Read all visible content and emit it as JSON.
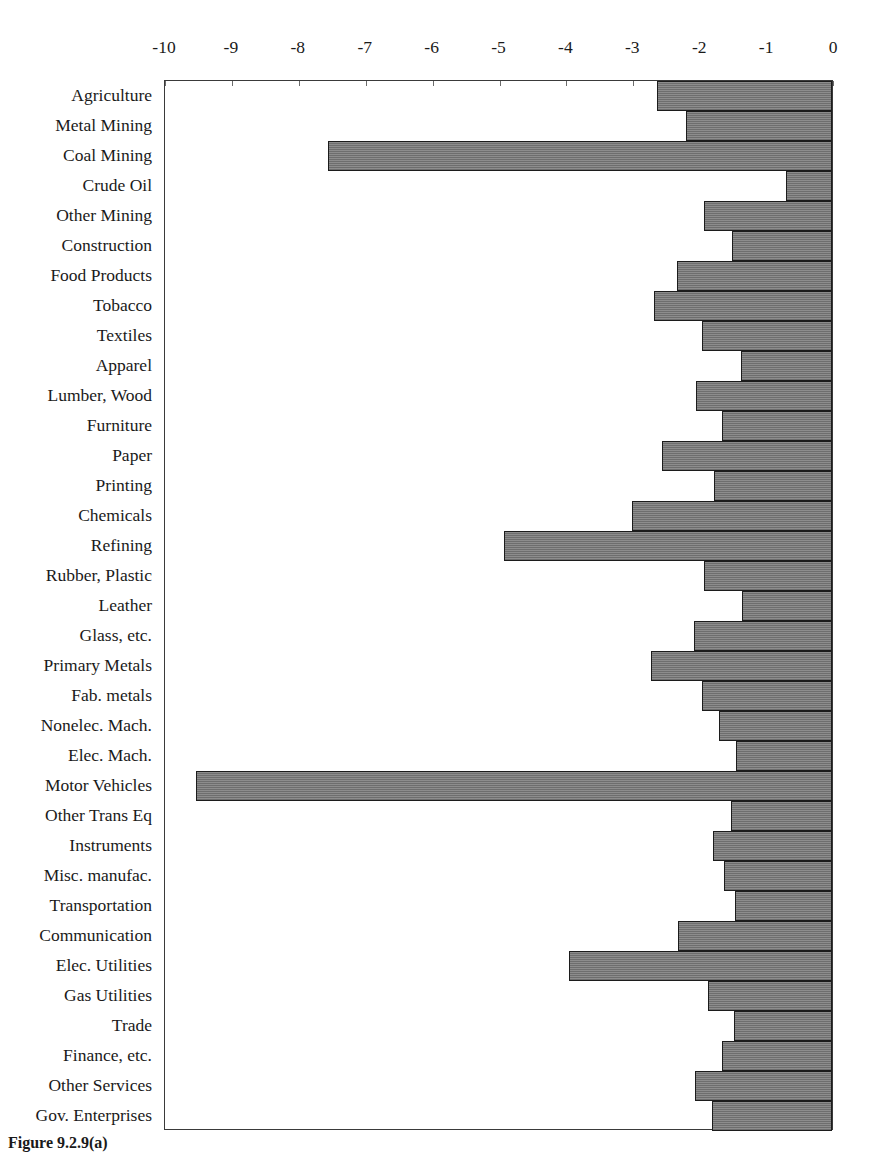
{
  "figure": {
    "caption": "Figure 9.2.9(a)",
    "bar_fill_color": "#808080",
    "bar_border_color": "#1c1c1c",
    "plot_border_color": "#3a3a3a",
    "background_color": "#ffffff"
  },
  "chart_data": {
    "type": "bar",
    "orientation": "horizontal",
    "title": "",
    "xlabel": "",
    "ylabel": "",
    "xlim": [
      -10,
      0
    ],
    "grid": false,
    "legend": null,
    "xticks": [
      -10,
      -9,
      -8,
      -7,
      -6,
      -5,
      -4,
      -3,
      -2,
      -1,
      0
    ],
    "xtick_labels": [
      "-10",
      "-9",
      "-8",
      "-7",
      "-6",
      "-5",
      "-4",
      "-3",
      "-2",
      "-1",
      "0"
    ],
    "categories": [
      "Agriculture",
      "Metal Mining",
      "Coal Mining",
      "Crude Oil",
      "Other Mining",
      "Construction",
      "Food Products",
      "Tobacco",
      "Textiles",
      "Apparel",
      "Lumber, Wood",
      "Furniture",
      "Paper",
      "Printing",
      "Chemicals",
      "Refining",
      "Rubber, Plastic",
      "Leather",
      "Glass, etc.",
      "Primary Metals",
      "Fab. metals",
      "Nonelec. Mach.",
      "Elec. Mach.",
      "Motor Vehicles",
      "Other Trans Eq",
      "Instruments",
      "Misc. manufac.",
      "Transportation",
      "Communication",
      "Elec. Utilities",
      "Gas Utilities",
      "Trade",
      "Finance, etc.",
      "Other Services",
      "Gov. Enterprises"
    ],
    "values": [
      -2.62,
      -2.18,
      -7.53,
      -0.69,
      -1.91,
      -1.49,
      -2.32,
      -2.66,
      -1.94,
      -1.36,
      -2.03,
      -1.64,
      -2.54,
      -1.76,
      -2.99,
      -4.9,
      -1.91,
      -1.35,
      -2.06,
      -2.71,
      -1.94,
      -1.69,
      -1.44,
      -9.5,
      -1.51,
      -1.78,
      -1.62,
      -1.45,
      -2.3,
      -3.93,
      -1.85,
      -1.47,
      -1.65,
      -2.05,
      -1.8
    ]
  }
}
